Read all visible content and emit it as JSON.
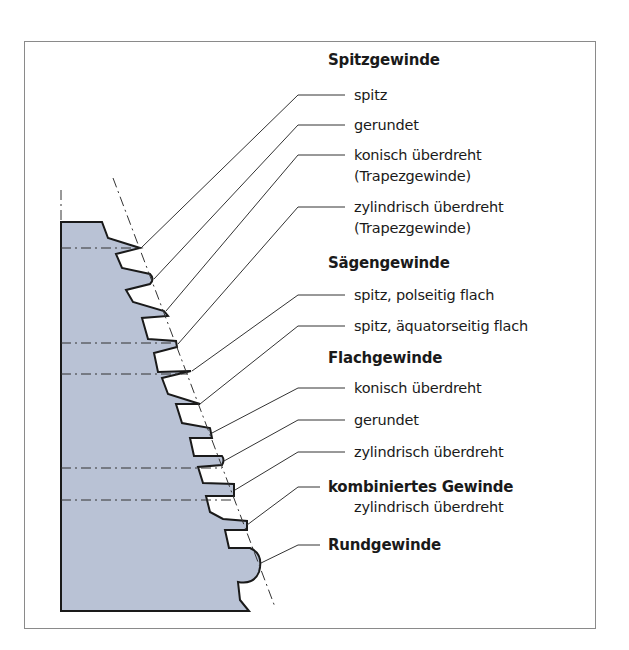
{
  "figure": {
    "colors": {
      "fill": "#b9c2d5",
      "outline": "#1a1a1a",
      "leader": "#333333",
      "frame": "#8a8a8a"
    }
  },
  "groups": [
    {
      "heading": "Spitzgewinde",
      "items": [
        {
          "label": "spitz"
        },
        {
          "label": "gerundet"
        },
        {
          "label": "konisch überdreht",
          "sub": "(Trapezgewinde)"
        },
        {
          "label": "zylindrisch überdreht",
          "sub": "(Trapezgewinde)"
        }
      ]
    },
    {
      "heading": "Sägengewinde",
      "items": [
        {
          "label": "spitz, polseitig flach"
        },
        {
          "label": "spitz, äquatorseitig flach"
        }
      ]
    },
    {
      "heading": "Flachgewinde",
      "items": [
        {
          "label": "konisch überdreht"
        },
        {
          "label": "gerundet"
        },
        {
          "label": "zylindrisch überdreht"
        }
      ]
    },
    {
      "heading": "kombiniertes Gewinde",
      "items": [
        {
          "label": "zylindrisch überdreht"
        }
      ]
    },
    {
      "heading": "Rundgewinde",
      "items": []
    }
  ]
}
